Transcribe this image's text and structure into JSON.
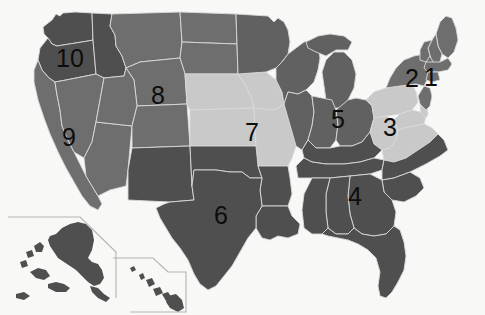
{
  "map": {
    "title": "United States Federal Regions Map",
    "background_color": "#f8f8f7",
    "border_color": "#d8d8d8",
    "inset_line_color": "#b0b0b0",
    "shades": {
      "dark": "#4f4f4f",
      "medium_dark": "#616161",
      "medium": "#6e6e6e",
      "light": "#c9c9c9"
    },
    "label_color": "#0d0d0d",
    "regions": [
      {
        "number": "1",
        "name": "region-1",
        "x": 424,
        "y": 65,
        "fill": "medium"
      },
      {
        "number": "2",
        "name": "region-2",
        "x": 405,
        "y": 66,
        "fill": "medium"
      },
      {
        "number": "3",
        "name": "region-3",
        "x": 383,
        "y": 115,
        "fill": "light"
      },
      {
        "number": "4",
        "name": "region-4",
        "x": 348,
        "y": 184,
        "fill": "dark"
      },
      {
        "number": "5",
        "name": "region-5",
        "x": 331,
        "y": 107,
        "fill": "dark"
      },
      {
        "number": "6",
        "name": "region-6",
        "x": 214,
        "y": 203,
        "fill": "dark"
      },
      {
        "number": "7",
        "name": "region-7",
        "x": 245,
        "y": 120,
        "fill": "light"
      },
      {
        "number": "8",
        "name": "region-8",
        "x": 151,
        "y": 83,
        "fill": "medium"
      },
      {
        "number": "9",
        "name": "region-9",
        "x": 62,
        "y": 125,
        "fill": "medium"
      },
      {
        "number": "10",
        "name": "region-10",
        "x": 56,
        "y": 46,
        "fill": "dark"
      }
    ],
    "insets": [
      {
        "name": "alaska-inset",
        "label": ""
      },
      {
        "name": "hawaii-inset",
        "label": ""
      }
    ]
  }
}
